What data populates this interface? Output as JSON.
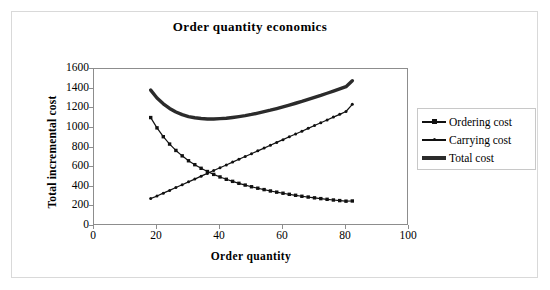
{
  "chart_data": {
    "type": "line",
    "title": "Order quantity economics",
    "xlabel": "Order quantity",
    "ylabel": "Total incremental cost",
    "xlim": [
      0,
      100
    ],
    "ylim": [
      0,
      1600
    ],
    "xticks": [
      "0",
      "20",
      "40",
      "60",
      "80",
      "100"
    ],
    "xtick_values": [
      0,
      20,
      40,
      60,
      80,
      100
    ],
    "yticks": [
      "0",
      "200",
      "400",
      "600",
      "800",
      "1000",
      "1200",
      "1400",
      "1600"
    ],
    "ytick_values": [
      0,
      200,
      400,
      600,
      800,
      1000,
      1200,
      1400,
      1600
    ],
    "grid": false,
    "legend_position": "right",
    "x": [
      18,
      20,
      22,
      24,
      26,
      28,
      30,
      32,
      34,
      36,
      38,
      40,
      42,
      44,
      46,
      48,
      50,
      52,
      54,
      56,
      58,
      60,
      62,
      64,
      66,
      68,
      70,
      72,
      74,
      76,
      78,
      80,
      82
    ],
    "series": [
      {
        "name": "Ordering cost",
        "marker": "square",
        "line_width": 1.2,
        "color": "#111111",
        "values": [
          1105,
          1000,
          910,
          835,
          770,
          715,
          665,
          625,
          588,
          555,
          526,
          500,
          476,
          455,
          435,
          417,
          400,
          385,
          371,
          357,
          345,
          334,
          323,
          313,
          303,
          295,
          287,
          279,
          272,
          265,
          259,
          253,
          255
        ]
      },
      {
        "name": "Carrying cost",
        "marker": "dot",
        "line_width": 1.2,
        "color": "#111111",
        "values": [
          280,
          305,
          335,
          363,
          392,
          420,
          450,
          478,
          508,
          536,
          565,
          594,
          622,
          651,
          680,
          708,
          737,
          766,
          794,
          823,
          852,
          880,
          909,
          938,
          966,
          995,
          1024,
          1052,
          1081,
          1110,
          1138,
          1167,
          1240
        ]
      },
      {
        "name": "Total cost",
        "marker": "none",
        "line_width": 3.4,
        "color": "#2b2b2b",
        "values": [
          1385,
          1305,
          1245,
          1198,
          1162,
          1135,
          1115,
          1103,
          1096,
          1091,
          1091,
          1094,
          1098,
          1106,
          1115,
          1125,
          1137,
          1151,
          1165,
          1180,
          1197,
          1214,
          1232,
          1251,
          1269,
          1290,
          1311,
          1331,
          1353,
          1375,
          1397,
          1420,
          1480
        ]
      }
    ],
    "annotations": {
      "crossover_note": "Ordering and carrying cost curves intersect near order quantity 38 at about 550",
      "minimum_note": "Total cost minimum near order quantity 36-40 at about 1090"
    }
  }
}
